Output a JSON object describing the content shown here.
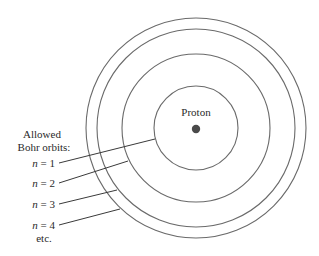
{
  "diagram": {
    "nucleus": {
      "label": "Proton",
      "cx": 196,
      "cy": 129,
      "r": 4,
      "color": "#4a4a4a"
    },
    "center": {
      "cx": 196,
      "cy": 128
    },
    "orbits": [
      {
        "n": 1,
        "r": 42
      },
      {
        "n": 2,
        "r": 74
      },
      {
        "n": 3,
        "r": 99
      },
      {
        "n": 4,
        "r": 110
      }
    ],
    "legend": {
      "heading_line1": "Allowed",
      "heading_line2": "Bohr orbits:",
      "items": [
        {
          "var": "n",
          "eq": " = 1",
          "line": [
            59,
            163,
            155,
            139
          ]
        },
        {
          "var": "n",
          "eq": " = 2",
          "line": [
            59,
            183,
            128,
            161
          ]
        },
        {
          "var": "n",
          "eq": " = 3",
          "line": [
            59,
            204,
            117,
            190
          ]
        },
        {
          "var": "n",
          "eq": " = 4",
          "line": [
            59,
            225,
            120,
            209
          ]
        }
      ],
      "etc": "etc."
    },
    "colors": {
      "orbit": "#6a6a6a",
      "leader": "#3a3a3a",
      "text": "#2a2a2a"
    }
  }
}
